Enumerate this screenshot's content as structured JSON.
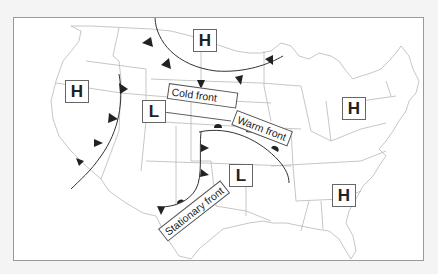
{
  "map": {
    "title": "",
    "region": "Contiguous United States",
    "colors": {
      "background": "#f4f4f4",
      "map_fill": "#ffffff",
      "border_lines": "#b8b8b8",
      "front_line": "#333333",
      "front_symbols": "#222222",
      "box_border": "#666666"
    }
  },
  "pressure_systems": [
    {
      "type": "high",
      "label": "H",
      "location": "northern plains (North Dakota)"
    },
    {
      "type": "high",
      "label": "H",
      "location": "Pacific Northwest / Oregon-California"
    },
    {
      "type": "low",
      "label": "L",
      "location": "Wyoming / Colorado"
    },
    {
      "type": "high",
      "label": "H",
      "location": "Pennsylvania / Ohio"
    },
    {
      "type": "low",
      "label": "L",
      "location": "Kansas / Oklahoma"
    },
    {
      "type": "high",
      "label": "H",
      "location": "Georgia"
    }
  ],
  "fronts": {
    "cold_front_label": "Cold front",
    "warm_front_label": "Warm front",
    "stationary_front_label": "Stationary front"
  },
  "legend_symbols": {
    "cold_front": "triangles",
    "warm_front": "semicircles",
    "stationary_front": "alternating triangles and semicircles"
  }
}
